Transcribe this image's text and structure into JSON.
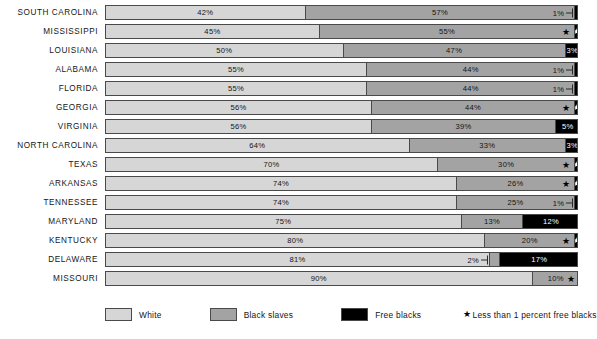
{
  "chart_data": {
    "type": "bar",
    "subtype": "stacked-horizontal-100pct",
    "title": "",
    "xlabel": "",
    "ylabel": "",
    "xlim": [
      0,
      100
    ],
    "grid": false,
    "legend_position": "bottom",
    "categories": [
      "SOUTH CAROLINA",
      "MISSISSIPPI",
      "LOUISIANA",
      "ALABAMA",
      "FLORIDA",
      "GEORGIA",
      "VIRGINIA",
      "NORTH CAROLINA",
      "TEXAS",
      "ARKANSAS",
      "TENNESSEE",
      "MARYLAND",
      "KENTUCKY",
      "DELAWARE",
      "MISSOURI"
    ],
    "series": [
      {
        "name": "White",
        "color": "#d6d6d6",
        "values": [
          42,
          45,
          50,
          55,
          55,
          56,
          56,
          64,
          70,
          74,
          74,
          75,
          80,
          81,
          90
        ]
      },
      {
        "name": "Black slaves",
        "color": "#a3a3a3",
        "values": [
          57,
          55,
          47,
          44,
          44,
          44,
          39,
          33,
          30,
          26,
          25,
          13,
          20,
          2,
          10
        ]
      },
      {
        "name": "Free blacks",
        "color": "#000000",
        "values": [
          1,
          0.5,
          3,
          1,
          1,
          0.5,
          5,
          3,
          0.5,
          0.5,
          1,
          12,
          0.5,
          17,
          0.5
        ]
      }
    ],
    "annotations": {
      "star_meaning": "Less than 1 percent free blacks"
    }
  },
  "rows": [
    {
      "state": "SOUTH CAROLINA",
      "white": {
        "pct": 42,
        "label": "42%"
      },
      "slaves": {
        "pct": 57,
        "label": "57%",
        "star": false
      },
      "free": {
        "pct": 1,
        "label": "1%",
        "star": false,
        "label_outside": true,
        "leader": true
      }
    },
    {
      "state": "MISSISSIPPI",
      "white": {
        "pct": 45,
        "label": "45%"
      },
      "slaves": {
        "pct": 54,
        "label": "55%",
        "star": true
      },
      "free": {
        "pct": 1,
        "label": "",
        "star": true,
        "label_outside": false,
        "leader": false
      }
    },
    {
      "state": "LOUISIANA",
      "white": {
        "pct": 50,
        "label": "50%"
      },
      "slaves": {
        "pct": 47,
        "label": "47%",
        "star": false
      },
      "free": {
        "pct": 3,
        "label": "3%",
        "star": false,
        "label_outside": false,
        "leader": false
      }
    },
    {
      "state": "ALABAMA",
      "white": {
        "pct": 55,
        "label": "55%"
      },
      "slaves": {
        "pct": 44,
        "label": "44%",
        "star": false
      },
      "free": {
        "pct": 1,
        "label": "1%",
        "star": false,
        "label_outside": true,
        "leader": true
      }
    },
    {
      "state": "FLORIDA",
      "white": {
        "pct": 55,
        "label": "55%"
      },
      "slaves": {
        "pct": 44,
        "label": "44%",
        "star": false
      },
      "free": {
        "pct": 1,
        "label": "1%",
        "star": false,
        "label_outside": true,
        "leader": true
      }
    },
    {
      "state": "GEORGIA",
      "white": {
        "pct": 56,
        "label": "56%"
      },
      "slaves": {
        "pct": 43,
        "label": "44%",
        "star": true
      },
      "free": {
        "pct": 1,
        "label": "",
        "star": true,
        "label_outside": false,
        "leader": false
      }
    },
    {
      "state": "VIRGINIA",
      "white": {
        "pct": 56,
        "label": "56%"
      },
      "slaves": {
        "pct": 39,
        "label": "39%",
        "star": false
      },
      "free": {
        "pct": 5,
        "label": "5%",
        "star": false,
        "label_outside": false,
        "leader": false
      }
    },
    {
      "state": "NORTH CAROLINA",
      "white": {
        "pct": 64,
        "label": "64%"
      },
      "slaves": {
        "pct": 33,
        "label": "33%",
        "star": false
      },
      "free": {
        "pct": 3,
        "label": "3%",
        "star": false,
        "label_outside": false,
        "leader": false
      }
    },
    {
      "state": "TEXAS",
      "white": {
        "pct": 70,
        "label": "70%"
      },
      "slaves": {
        "pct": 29,
        "label": "30%",
        "star": true
      },
      "free": {
        "pct": 1,
        "label": "",
        "star": true,
        "label_outside": false,
        "leader": false
      }
    },
    {
      "state": "ARKANSAS",
      "white": {
        "pct": 74,
        "label": "74%"
      },
      "slaves": {
        "pct": 25,
        "label": "26%",
        "star": true
      },
      "free": {
        "pct": 1,
        "label": "",
        "star": true,
        "label_outside": false,
        "leader": false
      }
    },
    {
      "state": "TENNESSEE",
      "white": {
        "pct": 74,
        "label": "74%"
      },
      "slaves": {
        "pct": 25,
        "label": "25%",
        "star": false
      },
      "free": {
        "pct": 1,
        "label": "1%",
        "star": false,
        "label_outside": true,
        "leader": true
      }
    },
    {
      "state": "MARYLAND",
      "white": {
        "pct": 75,
        "label": "75%"
      },
      "slaves": {
        "pct": 13,
        "label": "13%",
        "star": false
      },
      "free": {
        "pct": 12,
        "label": "12%",
        "star": false,
        "label_outside": false,
        "leader": false
      }
    },
    {
      "state": "KENTUCKY",
      "white": {
        "pct": 80,
        "label": "80%"
      },
      "slaves": {
        "pct": 19,
        "label": "20%",
        "star": true
      },
      "free": {
        "pct": 1,
        "label": "",
        "star": true,
        "label_outside": false,
        "leader": false
      }
    },
    {
      "state": "DELAWARE",
      "white": {
        "pct": 81,
        "label": "81%"
      },
      "slaves": {
        "pct": 2,
        "label": "2%",
        "star": false,
        "label_outside": true,
        "leader": true
      },
      "free": {
        "pct": 17,
        "label": "17%",
        "star": false,
        "label_outside": false,
        "leader": false
      }
    },
    {
      "state": "MISSOURI",
      "white": {
        "pct": 90,
        "label": "90%"
      },
      "slaves": {
        "pct": 10,
        "label": "10%",
        "star": true
      },
      "free": {
        "pct": 0,
        "label": "",
        "star": false,
        "label_outside": false,
        "leader": false
      }
    }
  ],
  "legend": {
    "white_label": "White",
    "slaves_label": "Black slaves",
    "free_label": "Free blacks",
    "star_glyph": "★",
    "star_note": "Less than 1 percent free blacks"
  }
}
